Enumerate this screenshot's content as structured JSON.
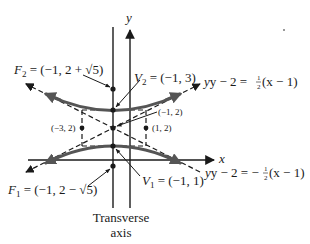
{
  "diagram": {
    "axes": {
      "x_label": "x",
      "y_label": "y"
    },
    "transverse_axis_label": {
      "line1": "Transverse",
      "line2": "axis"
    },
    "foci": {
      "F2": {
        "name": "F",
        "sub": "2",
        "value": " = (−1, 2 + √5)"
      },
      "F1": {
        "name": "F",
        "sub": "1",
        "value": " = (−1, 2 − √5)"
      }
    },
    "vertices": {
      "V2": {
        "name": "V",
        "sub": "2",
        "value": " = (−1, 3)"
      },
      "V1": {
        "name": "V",
        "sub": "1",
        "value": " = (−1, 1)"
      }
    },
    "points": {
      "center": "(−1, 2)",
      "left": "(−3, 2)",
      "right": "(1, 2)"
    },
    "asymptotes": {
      "upper": {
        "lhs": "y − 2 = ",
        "frac_num": "1",
        "frac_den": "2",
        "rhs": "(x − 1)"
      },
      "lower": {
        "lhs": "y − 2 = −",
        "frac_num": "1",
        "frac_den": "2",
        "rhs": "(x − 1)"
      }
    },
    "colors": {
      "ink": "#1a1a1a",
      "curve": "#555555",
      "background": "#ffffff"
    }
  }
}
